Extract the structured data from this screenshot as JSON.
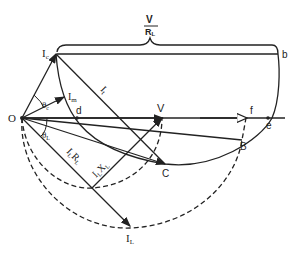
{
  "diagram": {
    "type": "phasor-circle-diagram",
    "colors": {
      "line": "#222222",
      "background": "#ffffff"
    },
    "labels": {
      "origin": "O",
      "ic": "I",
      "ic_sub": "c",
      "im": "I",
      "im_sub": "m",
      "it": "I",
      "it_sub": "t",
      "il": "I",
      "il_sub": "L",
      "theta_c": "θ",
      "theta_c_sub": "c",
      "theta_l": "θ",
      "theta_l_sub": "L",
      "ilrl": "I",
      "ilrl_sub1": "L",
      "ilrl_r": "R",
      "ilrl_sub2": "L",
      "ilxl": "I",
      "ilxl_sub1": "L",
      "ilxl_x": "X",
      "ilxl_sub2": "L",
      "v": "V",
      "d": "d",
      "f": "f",
      "e": "e",
      "b": "b",
      "c": "C",
      "B": "B",
      "brace_num": "V",
      "brace_den": "R",
      "brace_den_sub": "L"
    }
  }
}
